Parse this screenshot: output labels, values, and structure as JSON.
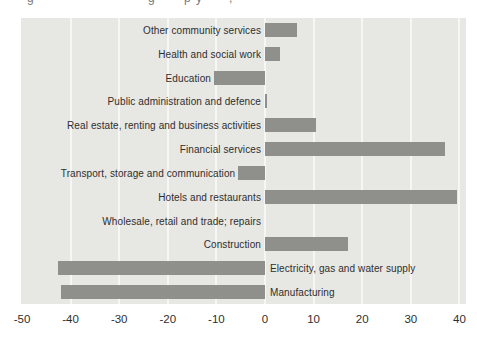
{
  "cropped_title": {
    "note": "top edge of a cropped text line; only letter bottoms visible",
    "fragments": [
      {
        "text": "g",
        "x": 27
      },
      {
        "text": "g",
        "x": 148
      },
      {
        "text": "p",
        "x": 184
      },
      {
        "text": "y",
        "x": 196
      },
      {
        "text": ",",
        "x": 229
      }
    ]
  },
  "chart_data": {
    "type": "bar",
    "orientation": "horizontal",
    "title": "",
    "xlabel": "",
    "ylabel": "",
    "xlim": [
      -50,
      41
    ],
    "xticks": [
      -50,
      -40,
      -30,
      -20,
      -10,
      0,
      10,
      20,
      30,
      40
    ],
    "xtick_labels": [
      "-50",
      "-40",
      "-30",
      "-20",
      "-10",
      "0",
      "10",
      "20",
      "30",
      "40"
    ],
    "grid": true,
    "legend": false,
    "categories": [
      "Other community services",
      "Health and social work",
      "Education",
      "Public administration and defence",
      "Real estate, renting and business activities",
      "Financial services",
      "Transport, storage and communication",
      "Hotels and restaurants",
      "Wholesale, retail and trade; repairs",
      "Construction",
      "Electricity, gas and water supply",
      "Manufacturing"
    ],
    "values": [
      6.5,
      3,
      -10.5,
      0.5,
      10.5,
      37,
      -5.5,
      39.5,
      0,
      17,
      -42.5,
      -42
    ],
    "colors": {
      "bar": "#8f8f8c",
      "plot_background": "#e7e7e4",
      "gridline": "#f6f6f4",
      "label_text": "#2e2e2e",
      "axis_text": "#2e2e2e",
      "page_background": "#ffffff"
    }
  }
}
